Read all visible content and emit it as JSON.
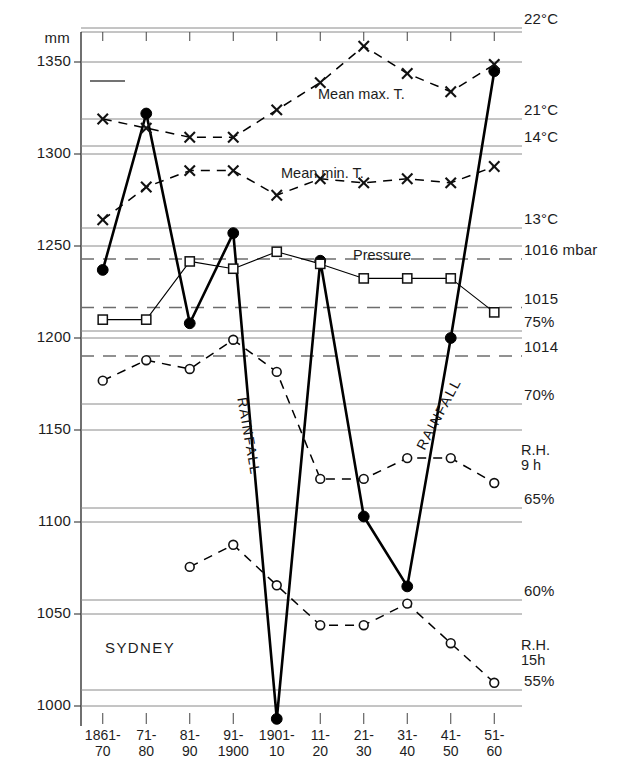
{
  "chart_data": {
    "type": "line",
    "title": "SYDNEY",
    "city": "SYDNEY",
    "grid": true,
    "legend_position": "inline-annotations",
    "x": [
      "1861-70",
      "71-80",
      "81-90",
      "91-1900",
      "1901-10",
      "11-20",
      "21-30",
      "31-40",
      "41-50",
      "51-60"
    ],
    "xtick_labels": [
      {
        "top": "1861-",
        "bottom": "70"
      },
      {
        "top": "71-",
        "bottom": "80"
      },
      {
        "top": "81-",
        "bottom": "90"
      },
      {
        "top": "91-",
        "bottom": "1900"
      },
      {
        "top": "1901-",
        "bottom": "10"
      },
      {
        "top": "11-",
        "bottom": "20"
      },
      {
        "top": "21-",
        "bottom": "30"
      },
      {
        "top": "31-",
        "bottom": "40"
      },
      {
        "top": "41-",
        "bottom": "50"
      },
      {
        "top": "51-",
        "bottom": "60"
      }
    ],
    "xlabel": "",
    "ylabel": "mm",
    "y_axis_left": {
      "unit": "mm",
      "unit_label": "mm",
      "ticks": [
        1350,
        1300,
        1250,
        1200,
        1150,
        1100,
        1050,
        1000
      ],
      "tick_labels": [
        "1350",
        "1300",
        "1250",
        "1200",
        "1150",
        "1100",
        "1050",
        "1000"
      ],
      "ylim": [
        1000,
        1350
      ]
    },
    "y_axis_right": {
      "labels": [
        {
          "text": "22°C",
          "value": 22,
          "scale": "mean_max_T"
        },
        {
          "text": "21°C",
          "value": 21,
          "scale": "mean_max_T"
        },
        {
          "text": "14°C",
          "value": 14,
          "scale": "mean_min_T"
        },
        {
          "text": "13°C",
          "value": 13,
          "scale": "mean_min_T"
        },
        {
          "text": "1016 mbar",
          "value": 1016,
          "scale": "pressure"
        },
        {
          "text": "1015",
          "value": 1015,
          "scale": "pressure"
        },
        {
          "text": "75%",
          "value": 75,
          "scale": "humidity"
        },
        {
          "text": "1014",
          "value": 1014,
          "scale": "pressure"
        },
        {
          "text": "70%",
          "value": 70,
          "scale": "humidity"
        },
        {
          "text": "65%",
          "value": 65,
          "scale": "humidity"
        },
        {
          "text": "60%",
          "value": 60,
          "scale": "humidity"
        },
        {
          "text": "55%",
          "value": 55,
          "scale": "humidity"
        }
      ]
    },
    "series": [
      {
        "name": "Rainfall",
        "label": "RAINFALL",
        "unit": "mm",
        "marker": "filled-circle",
        "linestyle": "solid",
        "linewidth": 2.6,
        "color": "#000000",
        "values": [
          1237,
          1322,
          1208,
          1257,
          993,
          1242,
          1103,
          1065,
          1200,
          1345
        ]
      },
      {
        "name": "Mean max. T.",
        "label": "Mean max. T.",
        "unit": "°C",
        "marker": "x",
        "linestyle": "dashed",
        "color": "#000000",
        "values": [
          21.0,
          20.9,
          20.8,
          20.8,
          21.1,
          21.4,
          21.8,
          21.5,
          21.3,
          21.6
        ]
      },
      {
        "name": "Mean min. T.",
        "label": "Mean min. T.",
        "unit": "°C",
        "marker": "x",
        "linestyle": "dashed",
        "color": "#000000",
        "values": [
          13.1,
          13.5,
          13.7,
          13.7,
          13.4,
          13.6,
          13.55,
          13.6,
          13.55,
          13.75
        ]
      },
      {
        "name": "Pressure",
        "label": "Pressure",
        "unit": "mbar",
        "marker": "open-square",
        "linestyle": "solid",
        "linewidth": 1.1,
        "color": "#000000",
        "values": [
          1014.75,
          1014.75,
          1015.95,
          1015.8,
          1016.15,
          1015.9,
          1015.6,
          1015.6,
          1015.6,
          1014.9
        ]
      },
      {
        "name": "R.H. 9 h",
        "label": "R.H.",
        "label2": "9 h",
        "unit": "%",
        "marker": "open-circle",
        "linestyle": "dashed",
        "color": "#000000",
        "values": [
          71.6,
          73.0,
          72.4,
          74.4,
          72.2,
          66.4,
          66.4,
          67.4,
          67.4,
          66.2
        ]
      },
      {
        "name": "R.H. 15 h",
        "label": "R.H.",
        "label2": "15h",
        "unit": "%",
        "marker": "open-circle",
        "linestyle": "dashed",
        "color": "#000000",
        "values": [
          null,
          null,
          61.8,
          63.0,
          60.8,
          58.6,
          58.6,
          59.8,
          57.6,
          55.4
        ]
      }
    ],
    "annotations": [
      {
        "text": "Mean max. T.",
        "x_frac": 0.47,
        "y_px": 96
      },
      {
        "text": "Mean min. T.",
        "x_frac": 0.4,
        "y_px": 175
      },
      {
        "text": "Pressure",
        "x_frac": 0.62,
        "y_px": 257
      },
      {
        "text": "RAINFALL",
        "x_px": 243,
        "y_px": 398,
        "rotation": 80
      },
      {
        "text": "RAINFALL",
        "x_px": 430,
        "y_px": 425,
        "rotation": -62
      },
      {
        "text": "SYDNEY",
        "x_px": 105,
        "y_px": 646
      }
    ]
  },
  "colors": {
    "grid": "#8a8a8a",
    "dashed_grid": "#6d6d6d",
    "ink": "#111111",
    "background": "#ffffff"
  }
}
